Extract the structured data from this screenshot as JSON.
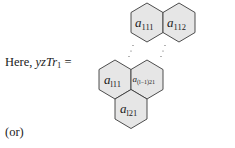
{
  "text": {
    "lead_word": "Here,",
    "lead_var": "yzTr",
    "lead_sub": "1",
    "equals": "=",
    "or": "(or)"
  },
  "hexagons": [
    {
      "id": "a111",
      "base": "a",
      "sub": "111"
    },
    {
      "id": "a112",
      "base": "a",
      "sub": "112"
    },
    {
      "id": "al11",
      "base": "a",
      "sub": "l11"
    },
    {
      "id": "a(l-1)21",
      "base": "a",
      "sub": "(l−1)21"
    },
    {
      "id": "al21",
      "base": "a",
      "sub": "l21"
    }
  ],
  "colors": {
    "hex_fill": "#e6e6e6",
    "hex_stroke": "#3a3a3a"
  }
}
